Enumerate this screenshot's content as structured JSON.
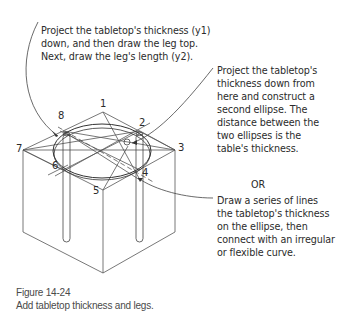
{
  "notes": {
    "leg_note": [
      "Project the tabletop's thickness (y1)",
      "down, and then draw the leg top.",
      "Next, draw the leg's length (y2)."
    ],
    "ellipse_note": [
      "Project the tabletop's",
      "thickness down from",
      "here and construct a",
      "second ellipse. The",
      "distance between the",
      "two ellipses is the",
      "table's thickness."
    ],
    "or_label": "OR",
    "lines_note": [
      "Draw a series of lines",
      "the tabletop's thickness",
      "on the ellipse, then",
      "connect with an irregular",
      "or flexible curve."
    ]
  },
  "points": {
    "p1": "1",
    "p2": "2",
    "p3": "3",
    "p4": "4",
    "p5": "5",
    "p6": "6",
    "p7": "7",
    "p8": "8"
  },
  "caption": {
    "figure_number": "Figure 14-24",
    "description": "Add tabletop thickness and legs."
  }
}
